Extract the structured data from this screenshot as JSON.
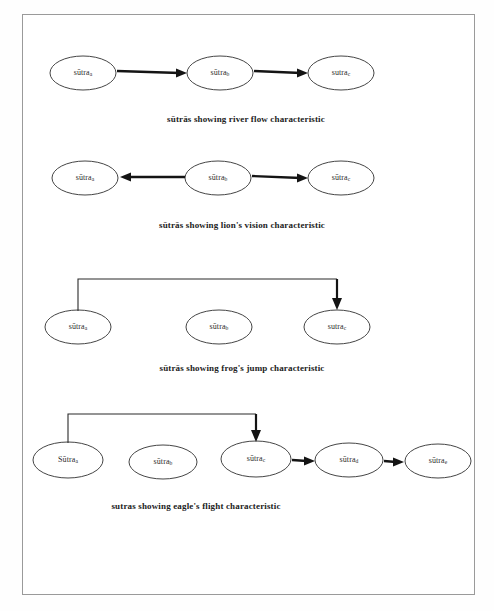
{
  "figure": {
    "background_color": "#ffffff",
    "border_color": "#9a9a9a",
    "node_stroke_color": "#303030",
    "arrow_color": "#141414"
  },
  "rows": [
    {
      "id": "river-flow",
      "caption": "sūtrās showing river flow characteristic",
      "nodes": [
        {
          "base": "sūtra",
          "sub": "a"
        },
        {
          "base": "sūtra",
          "sub": "b"
        },
        {
          "base": "sutra",
          "sub": "c"
        }
      ],
      "arrows": [
        {
          "from": "sūtra a",
          "to": "sūtra b",
          "style": "straight",
          "direction": "right"
        },
        {
          "from": "sūtra b",
          "to": "sutra c",
          "style": "straight",
          "direction": "right"
        }
      ]
    },
    {
      "id": "lion-vision",
      "caption": "sūtrās showing lion's vision  characteristic",
      "nodes": [
        {
          "base": "sūtra",
          "sub": "a"
        },
        {
          "base": "sūtra",
          "sub": "b"
        },
        {
          "base": "sūtra",
          "sub": "c"
        }
      ],
      "arrows": [
        {
          "from": "sūtra b",
          "to": "sūtra a",
          "style": "straight",
          "direction": "left"
        },
        {
          "from": "sūtra b",
          "to": "sūtra c",
          "style": "straight",
          "direction": "right"
        }
      ]
    },
    {
      "id": "frog-jump",
      "caption": "sūtrās showing frog's jump characteristic",
      "nodes": [
        {
          "base": "sūtra",
          "sub": "a"
        },
        {
          "base": "sūtra",
          "sub": "b"
        },
        {
          "base": "sutra",
          "sub": "c"
        }
      ],
      "arrows": [
        {
          "from": "sūtra a",
          "to": "sutra c",
          "style": "hook-over",
          "direction": "right"
        }
      ]
    },
    {
      "id": "eagle-flight",
      "caption": "sutras showing eagle's flight characteristic",
      "nodes": [
        {
          "base": "Sūtra",
          "sub": "a"
        },
        {
          "base": "sūtra",
          "sub": "b"
        },
        {
          "base": "sūtra",
          "sub": "c"
        },
        {
          "base": "sūtra",
          "sub": "d"
        },
        {
          "base": "sūtra",
          "sub": "e"
        }
      ],
      "arrows": [
        {
          "from": "Sūtra a",
          "to": "sūtra c",
          "style": "hook-over",
          "direction": "right"
        },
        {
          "from": "sūtra c",
          "to": "sūtra d",
          "style": "straight",
          "direction": "right"
        },
        {
          "from": "sūtra d",
          "to": "sūtra e",
          "style": "straight",
          "direction": "right"
        }
      ]
    }
  ]
}
